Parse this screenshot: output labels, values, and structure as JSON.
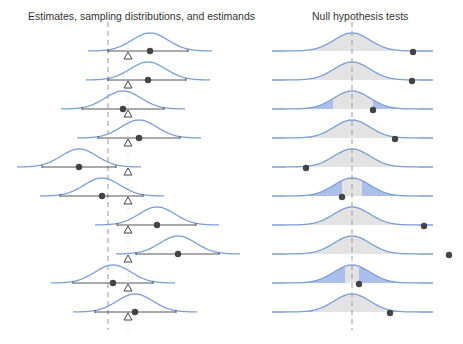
{
  "titles": {
    "left": "Estimates, sampling distributions, and estimands",
    "right": "Null hypothesis tests"
  },
  "colors": {
    "curve": "#7b9fd6",
    "rejection_fill": "#9db3e6",
    "acceptance_fill": "#e3e3e3",
    "point": "#444444",
    "interval": "#555555",
    "reference_line": "#999999"
  },
  "left_panel": {
    "null_line_x": 108,
    "estimand_line_x": 128,
    "rows": [
      {
        "y": 51,
        "center": 150,
        "estimate": 150,
        "ci": [
          108,
          188
        ]
      },
      {
        "y": 80,
        "center": 148,
        "estimate": 148,
        "ci": [
          108,
          186
        ]
      },
      {
        "y": 109,
        "center": 123,
        "estimate": 123,
        "ci": [
          82,
          164
        ]
      },
      {
        "y": 138,
        "center": 139,
        "estimate": 139,
        "ci": [
          98,
          180
        ]
      },
      {
        "y": 167,
        "center": 79,
        "estimate": 79,
        "ci": [
          42,
          116
        ]
      },
      {
        "y": 196,
        "center": 102,
        "estimate": 102,
        "ci": [
          60,
          143
        ]
      },
      {
        "y": 225,
        "center": 157,
        "estimate": 157,
        "ci": [
          117,
          196
        ]
      },
      {
        "y": 254,
        "center": 178,
        "estimate": 178,
        "ci": [
          136,
          219
        ]
      },
      {
        "y": 283,
        "center": 113,
        "estimate": 113,
        "ci": [
          73,
          153
        ]
      },
      {
        "y": 312,
        "center": 135,
        "estimate": 135,
        "ci": [
          95,
          176
        ]
      }
    ]
  },
  "right_panel": {
    "null_line_x": 352,
    "curve_left": 272,
    "curve_right": 433,
    "rows": [
      {
        "y": 51,
        "estimate": 413,
        "accept": [
          272,
          433
        ]
      },
      {
        "y": 80,
        "estimate": 412,
        "accept": [
          272,
          433
        ]
      },
      {
        "y": 109,
        "estimate": 373,
        "accept": [
          333,
          373
        ]
      },
      {
        "y": 138,
        "estimate": 395,
        "accept": [
          310,
          395
        ]
      },
      {
        "y": 167,
        "estimate": 306,
        "accept": [
          306,
          400
        ]
      },
      {
        "y": 196,
        "estimate": 342,
        "accept": [
          342,
          362
        ]
      },
      {
        "y": 225,
        "estimate": 424,
        "accept": [
          272,
          424
        ]
      },
      {
        "y": 254,
        "estimate": 449,
        "accept": [
          272,
          433
        ]
      },
      {
        "y": 283,
        "estimate": 359,
        "accept": [
          345,
          359
        ]
      },
      {
        "y": 312,
        "estimate": 390,
        "accept": [
          313,
          390
        ]
      }
    ]
  }
}
